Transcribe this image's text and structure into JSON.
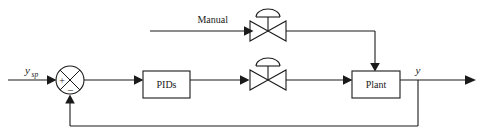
{
  "diagram": {
    "type": "block-diagram",
    "canvas": {
      "width": 482,
      "height": 138,
      "background": "#ffffff"
    },
    "stroke_color": "#1a1a1a",
    "labels": {
      "setpoint": "y",
      "setpoint_subscript": "sp",
      "manual": "Manual",
      "controller": "PIDs",
      "plant": "Plant",
      "output": "y",
      "sum_plus": "+",
      "sum_minus": "–"
    },
    "nodes": [
      {
        "id": "setpoint-input",
        "name": "setpoint-signal",
        "label": "y_sp",
        "x": 25,
        "y": 86
      },
      {
        "id": "summing-junction",
        "name": "summing-junction",
        "cx": 70,
        "cy": 80,
        "r": 14
      },
      {
        "id": "controller-block",
        "name": "pids-block",
        "label": "PIDs",
        "x": 143,
        "y": 71,
        "w": 47,
        "h": 27
      },
      {
        "id": "control-valve",
        "name": "control-valve",
        "cx": 268,
        "cy": 80
      },
      {
        "id": "manual-valve",
        "name": "manual-valve",
        "cx": 268,
        "cy": 31
      },
      {
        "id": "plant-block",
        "name": "plant-block",
        "label": "Plant",
        "x": 352,
        "y": 71,
        "w": 48,
        "h": 27
      },
      {
        "id": "output-signal",
        "name": "output-signal",
        "label": "y",
        "x": 418,
        "y": 70
      }
    ],
    "edges": [
      {
        "from": "setpoint-input",
        "to": "summing-junction",
        "name": "setpoint-to-sum"
      },
      {
        "from": "summing-junction",
        "to": "controller-block",
        "name": "error-to-pids"
      },
      {
        "from": "controller-block",
        "to": "control-valve",
        "name": "pids-to-valve"
      },
      {
        "from": "control-valve",
        "to": "plant-block",
        "name": "valve-to-plant"
      },
      {
        "from": "manual-input",
        "to": "manual-valve",
        "name": "manual-to-valve"
      },
      {
        "from": "manual-valve",
        "to": "plant-block",
        "name": "manual-valve-to-plant"
      },
      {
        "from": "plant-block",
        "to": "output-signal",
        "name": "plant-to-output"
      },
      {
        "from": "output-signal",
        "to": "summing-junction",
        "name": "feedback-path"
      }
    ]
  }
}
